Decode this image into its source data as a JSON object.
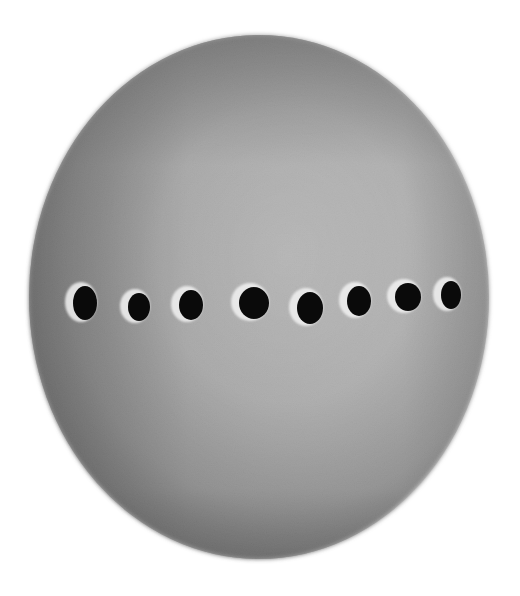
{
  "image": {
    "subject": "pencil drawing of a sphere with a horizontal row of dark spots",
    "background_color": "#ffffff",
    "sphere": {
      "shade_dark": "#4a4a4a",
      "shade_mid": "#8c8c8c",
      "shade_light": "#c9c9c9",
      "highlight": "#d8d8d8"
    },
    "spot_color": "#0a0a0a",
    "spot_rim_color": "#f2f2f2",
    "spot_count": 8
  }
}
